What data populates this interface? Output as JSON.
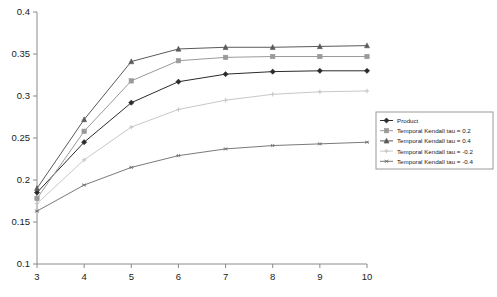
{
  "chart_data": {
    "type": "line",
    "title": "",
    "xlabel": "",
    "ylabel": "",
    "x": [
      3,
      4,
      5,
      6,
      7,
      8,
      9,
      10
    ],
    "xlim": [
      3,
      10
    ],
    "ylim": [
      0.1,
      0.4
    ],
    "xticks": [
      "3",
      "4",
      "5",
      "6",
      "7",
      "8",
      "9",
      "10"
    ],
    "yticks": [
      "0.1",
      "0.15",
      "0.2",
      "0.25",
      "0.3",
      "0.35",
      "0.4"
    ],
    "ytick_values": [
      0.1,
      0.15,
      0.2,
      0.25,
      0.3,
      0.35,
      0.4
    ],
    "grid": false,
    "legend_position": "right",
    "series": [
      {
        "name": "Product",
        "marker": "diamond",
        "color": "#2b2b2b",
        "values": [
          0.185,
          0.245,
          0.292,
          0.317,
          0.326,
          0.329,
          0.33,
          0.33
        ]
      },
      {
        "name": "Temporal Kendall tau = 0.2",
        "marker": "square",
        "color": "#9a9a9a",
        "values": [
          0.178,
          0.258,
          0.318,
          0.342,
          0.346,
          0.347,
          0.347,
          0.347
        ]
      },
      {
        "name": "Temporal Kendall tau = 0.4",
        "marker": "triangle",
        "color": "#5a5a5a",
        "values": [
          0.19,
          0.272,
          0.341,
          0.356,
          0.358,
          0.358,
          0.359,
          0.36
        ]
      },
      {
        "name": "Temporal Kendall tau = -0.2",
        "marker": "cross",
        "color": "#c8c8c8",
        "values": [
          0.172,
          0.224,
          0.263,
          0.284,
          0.295,
          0.302,
          0.305,
          0.306
        ]
      },
      {
        "name": "Temporal Kendall tau = -0.4",
        "marker": "asterisk",
        "color": "#7a7a7a",
        "values": [
          0.163,
          0.194,
          0.215,
          0.229,
          0.237,
          0.241,
          0.243,
          0.245
        ]
      }
    ]
  }
}
